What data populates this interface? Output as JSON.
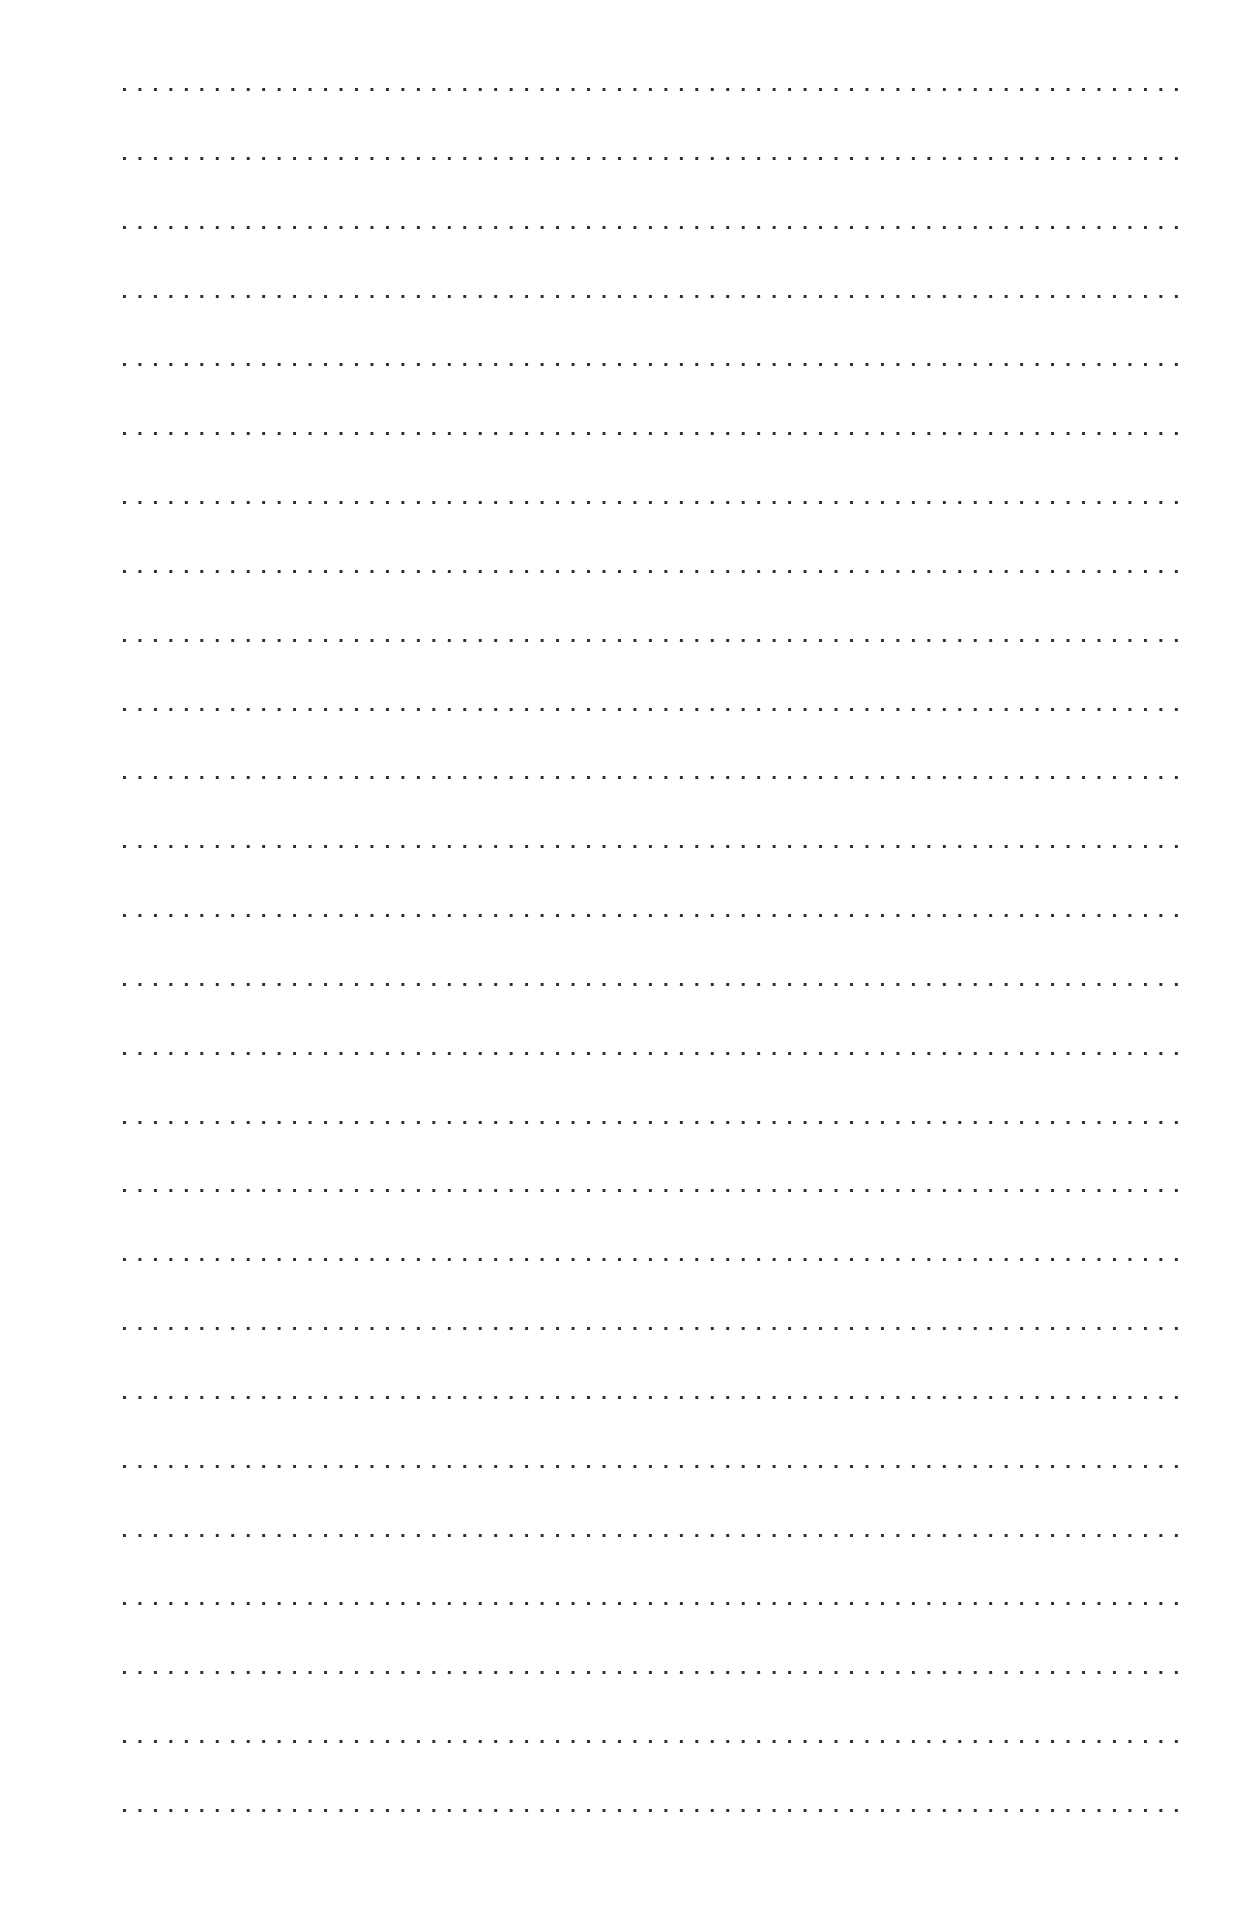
{
  "page": {
    "type": "dotted-ruled-writing-sheet",
    "line_count": 26,
    "first_line_y": 88,
    "line_spacing": 68.84,
    "line_left": 123,
    "line_width": 1058,
    "dot_color": "#2e2e2e",
    "background_color": "#ffffff"
  },
  "lines": [
    {
      "index": 1
    },
    {
      "index": 2
    },
    {
      "index": 3
    },
    {
      "index": 4
    },
    {
      "index": 5
    },
    {
      "index": 6
    },
    {
      "index": 7
    },
    {
      "index": 8
    },
    {
      "index": 9
    },
    {
      "index": 10
    },
    {
      "index": 11
    },
    {
      "index": 12
    },
    {
      "index": 13
    },
    {
      "index": 14
    },
    {
      "index": 15
    },
    {
      "index": 16
    },
    {
      "index": 17
    },
    {
      "index": 18
    },
    {
      "index": 19
    },
    {
      "index": 20
    },
    {
      "index": 21
    },
    {
      "index": 22
    },
    {
      "index": 23
    },
    {
      "index": 24
    },
    {
      "index": 25
    },
    {
      "index": 26
    }
  ]
}
